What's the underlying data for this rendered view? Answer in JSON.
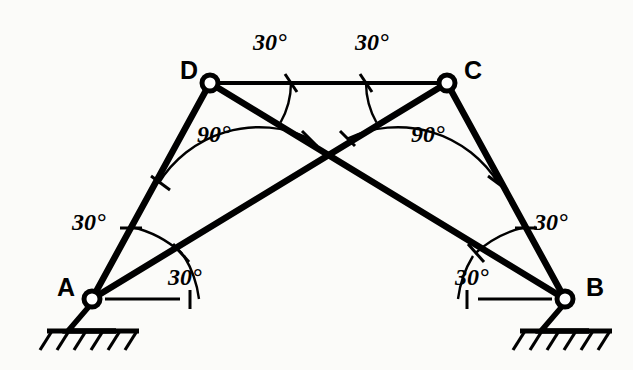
{
  "figure": {
    "kind": "structural-frame-angle-diagram",
    "background_color": "#fbfbf9",
    "line_color": "#000000",
    "width": 633,
    "height": 370
  },
  "nodes": [
    {
      "id": "A",
      "label": "A",
      "x": 92,
      "y": 299,
      "support": "pin",
      "label_x": 57,
      "label_y": 275
    },
    {
      "id": "B",
      "label": "B",
      "x": 565,
      "y": 299,
      "support": "pin",
      "label_x": 586,
      "label_y": 275
    },
    {
      "id": "C",
      "label": "C",
      "x": 447,
      "y": 83,
      "support": "none",
      "label_x": 464,
      "label_y": 58
    },
    {
      "id": "D",
      "label": "D",
      "x": 210,
      "y": 83,
      "support": "none",
      "label_x": 180,
      "label_y": 58
    }
  ],
  "members": [
    {
      "id": "AD",
      "from": "A",
      "to": "D",
      "style": "heavy"
    },
    {
      "id": "DC",
      "from": "D",
      "to": "C",
      "style": "light"
    },
    {
      "id": "CB",
      "from": "C",
      "to": "B",
      "style": "heavy"
    },
    {
      "id": "AC",
      "from": "A",
      "to": "C",
      "style": "heavy"
    },
    {
      "id": "DB",
      "from": "D",
      "to": "B",
      "style": "heavy"
    }
  ],
  "crossing_point": {
    "x": 328,
    "y": 185
  },
  "angles": [
    {
      "id": "angle-dc-dleft",
      "text": "30°",
      "vertex": "D",
      "value": 30,
      "label_x": 253,
      "label_y": 30
    },
    {
      "id": "angle-dc-cright",
      "text": "30°",
      "vertex": "C",
      "value": 30,
      "label_x": 355,
      "label_y": 30
    },
    {
      "id": "angle-d-interior",
      "text": "90°",
      "vertex": "D",
      "value": 90,
      "label_x": 197,
      "label_y": 122
    },
    {
      "id": "angle-c-interior",
      "text": "90°",
      "vertex": "C",
      "value": 90,
      "label_x": 411,
      "label_y": 122
    },
    {
      "id": "angle-a-upper",
      "text": "30°",
      "vertex": "A",
      "value": 30,
      "label_x": 72,
      "label_y": 210
    },
    {
      "id": "angle-a-lower",
      "text": "30°",
      "vertex": "A",
      "value": 30,
      "label_x": 168,
      "label_y": 265
    },
    {
      "id": "angle-b-upper",
      "text": "30°",
      "vertex": "B",
      "value": 30,
      "label_x": 534,
      "label_y": 210
    },
    {
      "id": "angle-b-lower",
      "text": "30°",
      "vertex": "B",
      "value": 30,
      "label_x": 455,
      "label_y": 265
    }
  ],
  "supports": {
    "type": "pin-with-hatched-ground",
    "A": {
      "ground_y": 331,
      "ground_x1": 47,
      "ground_x2": 139,
      "tri_half_width": 24,
      "hatch_count": 6
    },
    "B": {
      "ground_y": 331,
      "ground_x1": 520,
      "ground_x2": 612,
      "tri_half_width": 24,
      "hatch_count": 6
    }
  },
  "reference_lines": [
    {
      "id": "refline-A",
      "from_x": 105,
      "to_x": 180,
      "y": 299
    },
    {
      "id": "refline-B",
      "from_x": 478,
      "to_x": 552,
      "y": 299
    }
  ]
}
